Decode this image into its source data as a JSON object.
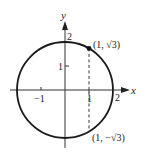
{
  "diagram": {
    "type": "circle-on-coordinate-plane",
    "equation_center": [
      0,
      0
    ],
    "radius": 2,
    "axes": {
      "x_label": "x",
      "y_label": "y",
      "x_ticks": [
        {
          "value": -1,
          "label": "−1"
        },
        {
          "value": 1,
          "label": "1"
        },
        {
          "value": 2,
          "label": "2"
        }
      ],
      "y_ticks": [
        {
          "value": 1,
          "label": "1"
        },
        {
          "value": 2,
          "label": "2"
        }
      ]
    },
    "points": [
      {
        "x": 1,
        "y": 1.732,
        "label": "(1, √3)",
        "marked": true
      },
      {
        "x": 1,
        "y": -1.732,
        "label": "(1, −√3)",
        "marked": false
      }
    ],
    "dashed_segment": {
      "from": [
        1,
        1.732
      ],
      "to": [
        1,
        -1.732
      ]
    },
    "colors": {
      "stroke": "#222222",
      "background": "#ffffff"
    }
  }
}
